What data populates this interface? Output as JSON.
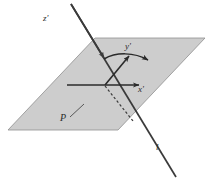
{
  "figure": {
    "kind": "geometry-diagram",
    "background_color": "#ffffff",
    "plane": {
      "name": "shaded-plane",
      "fill_color": "#cdcdcd",
      "stroke_color": "#8f8f8f",
      "points": "95,38 205,38 118,130 8,130"
    },
    "oblique_line": {
      "name": "line-l",
      "color": "#3a3a3a",
      "x1": 71,
      "y1": 4,
      "x2": 176,
      "y2": 177,
      "arrow_at": {
        "x": 104,
        "y": 58
      }
    },
    "x_axis": {
      "name": "x-axis",
      "color": "#2a2a2a",
      "x1": 67,
      "y1": 85,
      "x2": 141,
      "y2": 85
    },
    "y_axis": {
      "name": "y-axis",
      "color": "#2a2a2a",
      "x1": 105,
      "y1": 85,
      "x2": 131,
      "y2": 54
    },
    "curved_arrow": {
      "name": "curved-arrow",
      "color": "#2a2a2a",
      "path": "M 104,59 C 116,52 134,52 148,60"
    },
    "dashed_segment": {
      "name": "dashed-segment",
      "color": "#3a3a3a",
      "x1": 105,
      "y1": 86,
      "x2": 133,
      "y2": 121,
      "dash": "2.5 2.2"
    },
    "p_leader": {
      "name": "p-leader-line",
      "color": "#4a4a4a",
      "x1": 70,
      "y1": 117,
      "x2": 84,
      "y2": 104
    },
    "labels": {
      "z_axis": "z'",
      "y_axis": "y'",
      "x_axis": "x'",
      "point_p": "P",
      "line_l": "l"
    }
  }
}
